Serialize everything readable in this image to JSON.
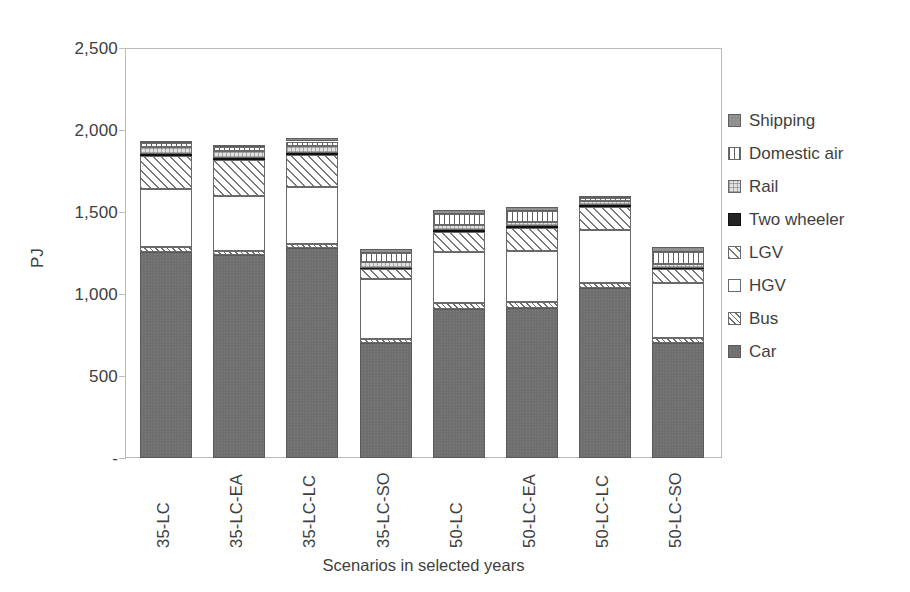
{
  "chart_data": {
    "type": "bar",
    "subtype": "stacked-bar",
    "title": "",
    "xlabel": "Scenarios in selected years",
    "ylabel": "PJ",
    "ylim": [
      0,
      2500
    ],
    "yticks": [
      0,
      500,
      1000,
      1500,
      2000,
      2500
    ],
    "ytick_labels": [
      "-",
      "500",
      "1,000",
      "1,500",
      "2,000",
      "2,500"
    ],
    "grid": false,
    "legend_position": "right",
    "categories": [
      "35-LC",
      "35-LC-EA",
      "35-LC-LC",
      "35-LC-SO",
      "50-LC",
      "50-LC-EA",
      "50-LC-LC",
      "50-LC-SO"
    ],
    "stack_order_bottom_to_top": [
      "Car",
      "Bus",
      "HGV",
      "LGV",
      "Two wheeler",
      "Rail",
      "Domestic air",
      "Shipping"
    ],
    "series": [
      {
        "name": "Car",
        "pattern": "solid-dark-gray",
        "color": "#6f6f6f",
        "values": [
          1255,
          1235,
          1280,
          700,
          910,
          915,
          1035,
          700
        ]
      },
      {
        "name": "Bus",
        "pattern": "dense-diagonal",
        "color": "#ffffff",
        "values": [
          30,
          30,
          25,
          25,
          35,
          35,
          30,
          30
        ]
      },
      {
        "name": "HGV",
        "pattern": "solid-white",
        "color": "#ffffff",
        "values": [
          355,
          335,
          345,
          365,
          310,
          315,
          325,
          335
        ]
      },
      {
        "name": "LGV",
        "pattern": "wide-diagonal",
        "color": "#ffffff",
        "values": [
          200,
          215,
          195,
          60,
          125,
          140,
          140,
          85
        ]
      },
      {
        "name": "Two wheeler",
        "pattern": "solid-black",
        "color": "#242424",
        "values": [
          15,
          15,
          15,
          10,
          10,
          10,
          10,
          10
        ]
      },
      {
        "name": "Rail",
        "pattern": "light-grid",
        "color": "#e2e2e2",
        "values": [
          40,
          40,
          40,
          35,
          30,
          25,
          25,
          25
        ]
      },
      {
        "name": "Domestic air",
        "pattern": "vertical-lines",
        "color": "#ffffff",
        "values": [
          25,
          25,
          30,
          55,
          70,
          65,
          20,
          70
        ]
      },
      {
        "name": "Shipping",
        "pattern": "solid-mid-gray",
        "color": "#8e8e8e",
        "values": [
          15,
          15,
          20,
          25,
          25,
          25,
          15,
          30
        ]
      }
    ],
    "totals": [
      1935,
      1910,
      1950,
      1275,
      1515,
      1530,
      1600,
      1285
    ]
  },
  "legend": {
    "items": [
      {
        "label": "Shipping",
        "swatch": "shipping-swatch-icon"
      },
      {
        "label": "Domestic air",
        "swatch": "domestic-air-swatch-icon"
      },
      {
        "label": "Rail",
        "swatch": "rail-swatch-icon"
      },
      {
        "label": "Two wheeler",
        "swatch": "two-wheeler-swatch-icon"
      },
      {
        "label": "LGV",
        "swatch": "lgv-swatch-icon"
      },
      {
        "label": "HGV",
        "swatch": "hgv-swatch-icon"
      },
      {
        "label": "Bus",
        "swatch": "bus-swatch-icon"
      },
      {
        "label": "Car",
        "swatch": "car-swatch-icon"
      }
    ]
  }
}
